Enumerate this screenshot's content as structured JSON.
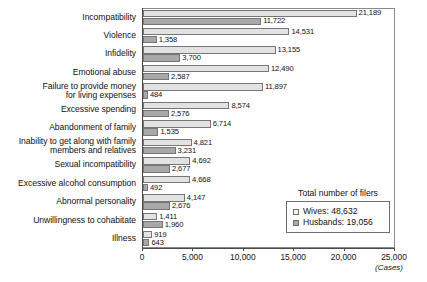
{
  "chart_data": {
    "type": "bar",
    "orientation": "horizontal",
    "title": "",
    "xlabel": "(Cases)",
    "ylabel": "",
    "xlim": [
      0,
      25000
    ],
    "xticks": [
      "0",
      "5,000",
      "10,000",
      "15,000",
      "20,000",
      "25,000"
    ],
    "xtick_values": [
      0,
      5000,
      10000,
      15000,
      20000,
      25000
    ],
    "grid": false,
    "legend_position": "inside-bottom-right",
    "categories": [
      "Incompatibility",
      "Violence",
      "Infidelity",
      "Emotional abuse",
      "Failure to provide money\nfor living expenses",
      "Excessive spending",
      "Abandonment of family",
      "Inability to get along with family\nmembers and relatives",
      "Sexual incompatibility",
      "Excessive alcohol consumption",
      "Abnormal personality",
      "Unwillingness to cohabitate",
      "Illness"
    ],
    "series": [
      {
        "name": "Wives",
        "color": "#e2e2e2",
        "values": [
          21189,
          14531,
          13155,
          12490,
          11897,
          8574,
          6714,
          4821,
          4692,
          4668,
          4147,
          1411,
          919
        ],
        "labels": [
          "21,189",
          "14,531",
          "13,155",
          "12,490",
          "11,897",
          "8,574",
          "6,714",
          "4,821",
          "4,692",
          "4,668",
          "4,147",
          "1,411",
          "919"
        ]
      },
      {
        "name": "Husbands",
        "color": "#a8a8a8",
        "values": [
          11722,
          1358,
          3700,
          2587,
          484,
          2576,
          1535,
          3231,
          2677,
          492,
          2676,
          1960,
          643
        ],
        "labels": [
          "11,722",
          "1,358",
          "3,700",
          "2,587",
          "484",
          "2,576",
          "1,535",
          "3,231",
          "2,677",
          "492",
          "2,676",
          "1,960",
          "643"
        ]
      }
    ]
  },
  "legend": {
    "title": "Total number of filers",
    "entries": [
      {
        "label": "Wives: 48,632",
        "swatch": "wives"
      },
      {
        "label": "Husbands: 19,056",
        "swatch": "husbands"
      }
    ]
  }
}
